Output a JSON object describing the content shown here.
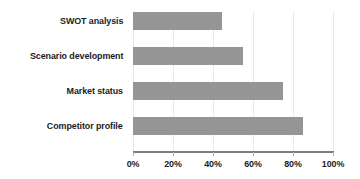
{
  "chart_data": {
    "type": "bar",
    "orientation": "horizontal",
    "title": "",
    "xlabel": "",
    "ylabel": "",
    "categories": [
      "Competitor profile",
      "Market status",
      "Scenario development",
      "SWOT analysis"
    ],
    "values": [
      85,
      75,
      55,
      44.5
    ],
    "value_format": "percent",
    "xlim": [
      0,
      100
    ],
    "xticks": [
      0,
      20,
      40,
      60,
      80,
      100
    ],
    "xtick_labels": [
      "0%",
      "20%",
      "40%",
      "60%",
      "80%",
      "100%"
    ],
    "grid": "vertical",
    "legend": "none",
    "series": [
      {
        "name": "",
        "color": "#959595",
        "points": [
          {
            "category": "SWOT analysis",
            "value": 44.5,
            "label": "44.5%"
          },
          {
            "category": "Scenario development",
            "value": 55,
            "label": "55%"
          },
          {
            "category": "Market status",
            "value": 75,
            "label": "75%"
          },
          {
            "category": "Competitor profile",
            "value": 85,
            "label": "85%"
          }
        ]
      }
    ],
    "display_order_top_to_bottom": [
      "SWOT analysis",
      "Scenario development",
      "Market status",
      "Competitor profile"
    ],
    "colors": {
      "bar": "#959595",
      "axis": "#7b7b7b",
      "gridline": "#e9e9e9",
      "tick": "#b4b4b4",
      "text": "#1c1c1c",
      "background": "#ffffff"
    }
  }
}
